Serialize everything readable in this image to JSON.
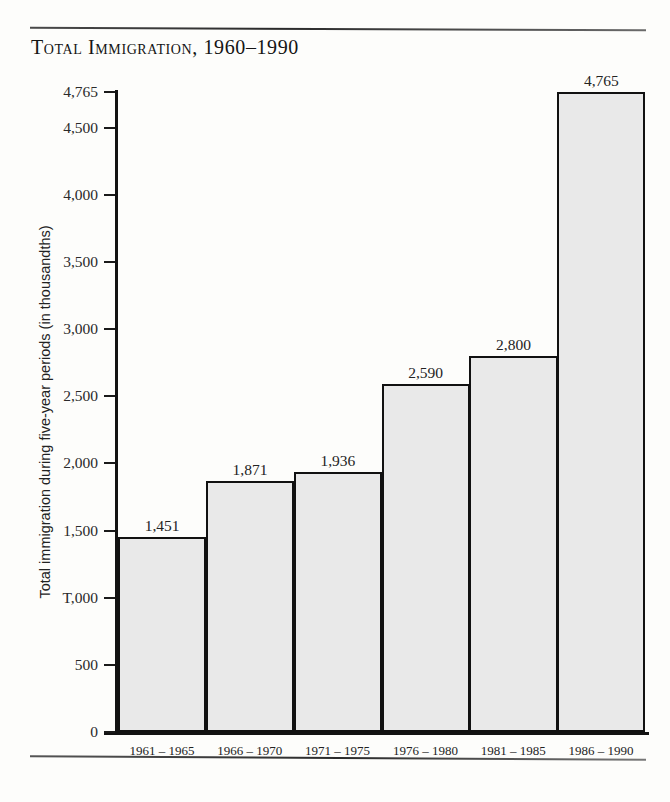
{
  "chart_data": {
    "type": "bar",
    "title": "Total Immigration, 1960–1990",
    "xlabel": "",
    "ylabel": "Total immigration during five-year periods (in thousandths)",
    "categories": [
      "1961 – 1965",
      "1966 – 1970",
      "1971 – 1975",
      "1976 – 1980",
      "1981 – 1985",
      "1986 – 1990"
    ],
    "values": [
      1451,
      1871,
      1936,
      2590,
      2800,
      4765
    ],
    "value_labels": [
      "1,451",
      "1,871",
      "1,936",
      "2,590",
      "2,800",
      "4,765"
    ],
    "ylim": [
      0,
      4765
    ],
    "yticks": [
      0,
      500,
      1000,
      1500,
      2000,
      2500,
      3000,
      3500,
      4000,
      4500,
      4765
    ],
    "ytick_labels": [
      "0",
      "500",
      "T,000",
      "1,500",
      "2,000",
      "2,500",
      "3,000",
      "3,500",
      "4,000",
      "4,500",
      "4,765"
    ],
    "grid": false,
    "legend": false,
    "bar_fill_color": "#e9e9e9",
    "bar_border_color": "#111111",
    "axis_color": "#121212",
    "background_color": "#fdfdfb"
  }
}
